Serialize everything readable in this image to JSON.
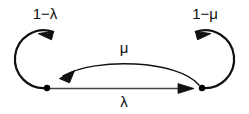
{
  "diagram": {
    "type": "state-transition-diagram",
    "title": "",
    "colors": {
      "stroke": "#111111",
      "thin_stroke": "#444444",
      "node_fill": "#000000",
      "background": "#ffffff",
      "text": "#111111"
    },
    "nodes": [
      {
        "id": "left-state",
        "name": "left-state-node",
        "cx": 47,
        "cy": 88,
        "r": 3.2
      },
      {
        "id": "right-state",
        "name": "right-state-node",
        "cx": 202,
        "cy": 88,
        "r": 3.2
      }
    ],
    "self_loops": [
      {
        "id": "left-self-loop",
        "label": "1−λ",
        "label_x": 45,
        "label_y": 19,
        "cx": 47,
        "cy": 59,
        "r": 29,
        "direction": "counterclockwise"
      },
      {
        "id": "right-self-loop",
        "label": "1−μ",
        "label_x": 205,
        "label_y": 19,
        "cx": 202,
        "cy": 59,
        "r": 29,
        "direction": "clockwise"
      }
    ],
    "transitions": [
      {
        "id": "mu-transition",
        "label": "μ",
        "label_x": 124,
        "label_y": 53,
        "from": "right-state",
        "to": "left-state",
        "shape": "arc-upward"
      },
      {
        "id": "lambda-transition",
        "label": "λ",
        "label_x": 124,
        "label_y": 107,
        "from": "left-state",
        "to": "right-state",
        "shape": "straight"
      }
    ]
  }
}
